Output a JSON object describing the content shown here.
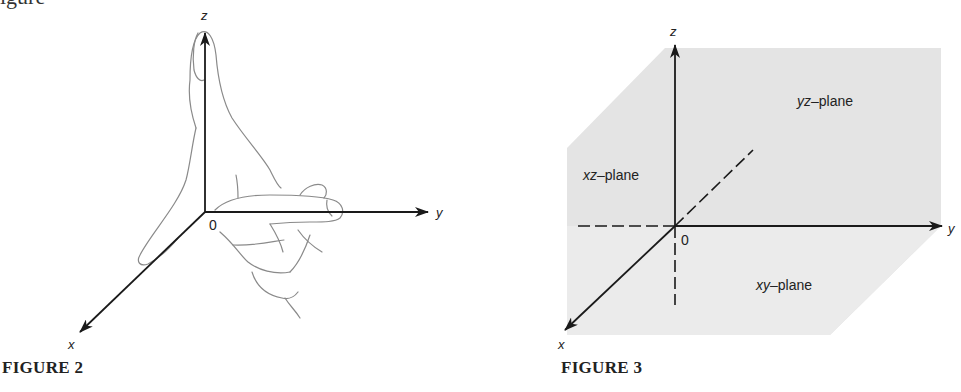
{
  "page": {
    "top_fragment": "igure"
  },
  "figure2": {
    "caption": "FIGURE 2",
    "axes": {
      "x": "x",
      "y": "y",
      "z": "z",
      "origin": "0"
    },
    "illustration": "right-hand rule hand with thumb along z and index finger along y"
  },
  "figure3": {
    "caption": "FIGURE 3",
    "axes": {
      "x": "x",
      "y": "y",
      "z": "z",
      "origin": "0"
    },
    "planes": {
      "yz": {
        "var": "yz",
        "suffix": "–plane"
      },
      "xz": {
        "var": "xz",
        "suffix": "–plane"
      },
      "xy": {
        "var": "xy",
        "suffix": "–plane"
      }
    },
    "colors": {
      "plane_fill": "#e4e4e4",
      "axis": "#1a1a1a"
    }
  }
}
